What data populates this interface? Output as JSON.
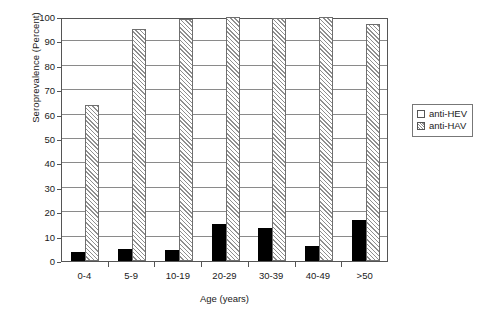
{
  "chart_data": {
    "type": "bar",
    "title": "",
    "xlabel": "Age (years)",
    "ylabel": "Seroprevalence (Percent)",
    "categories": [
      "0-4",
      "5-9",
      "10-19",
      "20-29",
      "30-39",
      "40-49",
      ">50"
    ],
    "series": [
      {
        "name": "anti-HEV",
        "fill": "solid-black",
        "color": "#000000",
        "values": [
          3.5,
          5.0,
          4.5,
          15.0,
          13.5,
          6.0,
          17.0
        ]
      },
      {
        "name": "anti-HAV",
        "fill": "diagonal-hatch",
        "color": "#8f8f8f",
        "values": [
          64.0,
          95.0,
          99.0,
          100.0,
          99.5,
          100.0,
          97.0
        ]
      }
    ],
    "ylim": [
      0,
      100
    ],
    "ytick_values": [
      0,
      10,
      20,
      30,
      40,
      50,
      60,
      70,
      80,
      90,
      100
    ],
    "ytick_labels": [
      "0",
      "10",
      "20",
      "30",
      "40",
      "50",
      "60",
      "70",
      "80",
      "90",
      "100"
    ],
    "grid": true,
    "grid_axis": "y",
    "legend_position": "right"
  },
  "legend": {
    "entries": [
      {
        "label": "anti-HEV"
      },
      {
        "label": "anti-HAV"
      }
    ]
  }
}
